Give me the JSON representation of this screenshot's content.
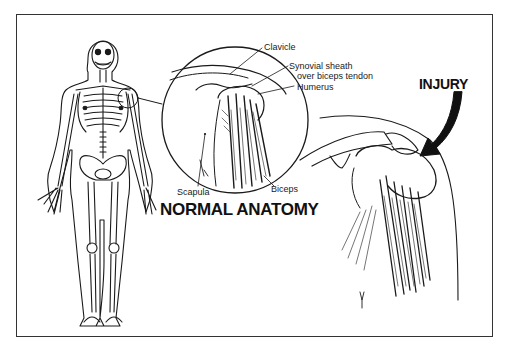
{
  "figure": {
    "titles": {
      "normal": "NORMAL ANATOMY",
      "injury": "INJURY"
    },
    "labels": {
      "clavicle": "Clavicle",
      "synovial_line1": "Synovial sheath",
      "synovial_line2": "over biceps tendon",
      "humerus": "Humerus",
      "scapula": "Scapula",
      "biceps": "Biceps"
    },
    "panels": [
      "full-body-skeleton",
      "normal-shoulder-inset",
      "injured-shoulder"
    ],
    "colors": {
      "ink": "#1a1a1a",
      "background": "#ffffff",
      "frame": "#333333"
    }
  }
}
